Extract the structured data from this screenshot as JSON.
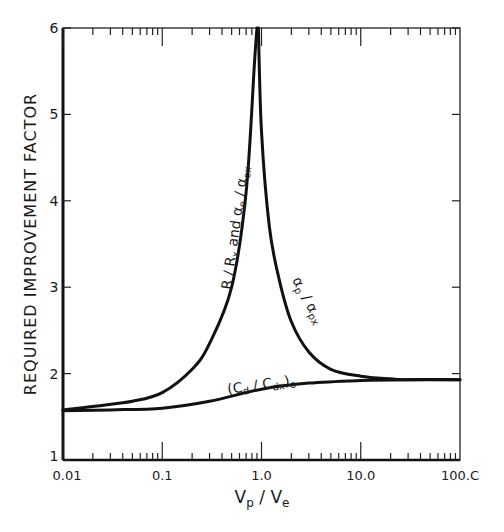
{
  "chart_data": {
    "type": "line",
    "title": "",
    "xlabel": "Vp / Ve",
    "ylabel": "REQUIRED IMPROVEMENT FACTOR",
    "xscale": "log",
    "xlim": [
      0.01,
      100.0
    ],
    "ylim": [
      1,
      6
    ],
    "x_tick_labels": [
      "0.01",
      "0.1",
      "1.0",
      "10.0",
      "100.C"
    ],
    "x_ticks": [
      0.01,
      0.1,
      1.0,
      10.0,
      100.0
    ],
    "y_tick_labels": [
      "1",
      "2",
      "3",
      "4",
      "5",
      "6"
    ],
    "y_ticks": [
      1,
      2,
      3,
      4,
      5,
      6
    ],
    "grid": false,
    "legend": null,
    "annotations": [
      {
        "text": "R/Rx and αe/αex",
        "near_x": 0.5,
        "near_y": 3.8,
        "rotation": -82
      },
      {
        "text": "αp/αpx",
        "near_x": 2.0,
        "near_y": 2.6,
        "rotation": 60
      },
      {
        "text": "(Cd/Cdx)o",
        "near_x": 0.6,
        "near_y": 1.95,
        "rotation": -8
      }
    ],
    "series": [
      {
        "name": "R/Rx and αe/αex",
        "x": [
          0.01,
          0.02,
          0.05,
          0.1,
          0.2,
          0.3,
          0.5,
          0.7,
          0.85,
          0.9
        ],
        "y": [
          1.58,
          1.62,
          1.68,
          1.78,
          2.05,
          2.35,
          3.0,
          4.1,
          5.6,
          6.0
        ]
      },
      {
        "name": "αp/αpx",
        "x": [
          0.93,
          1.0,
          1.2,
          1.5,
          2.0,
          3.0,
          5.0,
          10.0,
          20.0,
          30.0,
          100.0
        ],
        "y": [
          6.0,
          4.8,
          3.7,
          3.1,
          2.6,
          2.25,
          2.05,
          1.97,
          1.94,
          1.93,
          1.93
        ]
      },
      {
        "name": "(Cd/Cdx)o",
        "x": [
          0.01,
          0.03,
          0.1,
          0.3,
          1.0,
          3.0,
          10.0,
          30.0,
          100.0
        ],
        "y": [
          1.57,
          1.58,
          1.6,
          1.68,
          1.82,
          1.89,
          1.92,
          1.93,
          1.93
        ]
      }
    ]
  }
}
